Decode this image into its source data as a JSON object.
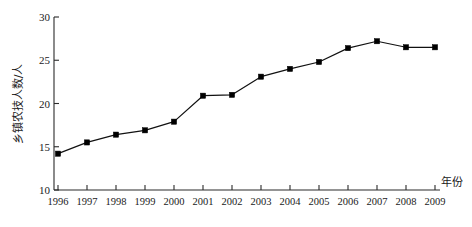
{
  "chart_data": {
    "type": "line",
    "title": "",
    "xlabel": "年份",
    "ylabel": "乡镇农技人数/人",
    "categories": [
      "1996",
      "1997",
      "1998",
      "1999",
      "2000",
      "2001",
      "2002",
      "2003",
      "2004",
      "2005",
      "2006",
      "2007",
      "2008",
      "2009"
    ],
    "values": [
      14.2,
      15.5,
      16.4,
      16.9,
      17.9,
      20.9,
      21.0,
      23.1,
      24.0,
      24.8,
      26.4,
      27.2,
      26.5,
      26.5
    ],
    "series": [
      {
        "name": "乡镇农技人数",
        "values": [
          14.2,
          15.5,
          16.4,
          16.9,
          17.9,
          20.9,
          21.0,
          23.1,
          24.0,
          24.8,
          26.4,
          27.2,
          26.5,
          26.5
        ]
      }
    ],
    "ylim": [
      10,
      30
    ],
    "yticks": [
      10,
      15,
      20,
      25,
      30
    ],
    "ytick_labels": [
      "10",
      "15",
      "20",
      "25",
      "30"
    ],
    "xtick_labels": [
      "1996",
      "1997",
      "1998",
      "1999",
      "2000",
      "2001",
      "2002",
      "2003",
      "2004",
      "2005",
      "2006",
      "2007",
      "2008",
      "2009"
    ],
    "grid": false,
    "legend": false,
    "legend_position": "none",
    "marker": "square",
    "line_color": "#111111",
    "marker_color": "#000000",
    "axis_color": "#2b2b2b",
    "background": "#ffffff"
  },
  "axis": {
    "x_title": "年份",
    "y_title": "乡镇农技人数/人"
  }
}
